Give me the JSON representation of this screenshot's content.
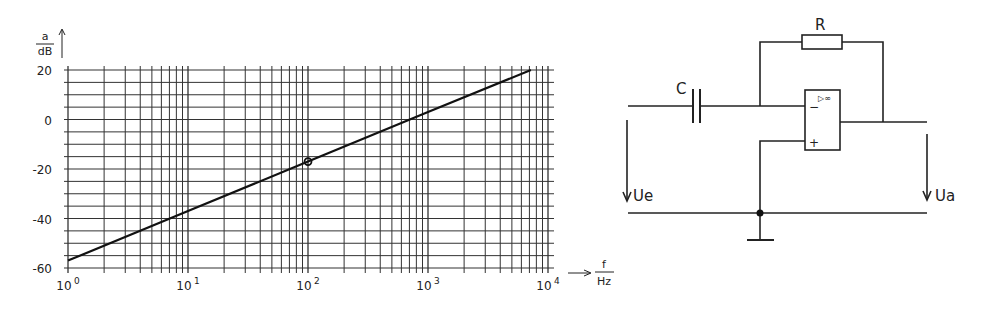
{
  "chart_data": {
    "type": "line",
    "title": "",
    "xlabel_num": "f",
    "xlabel_den": "Hz",
    "ylabel_num": "a",
    "ylabel_den": "dB",
    "xscale": "log",
    "xlim": [
      1,
      10000
    ],
    "ylim": [
      -60,
      20
    ],
    "grid": true,
    "legend": null,
    "x_ticks": [
      {
        "base": "10",
        "exp": "0"
      },
      {
        "base": "10",
        "exp": "1"
      },
      {
        "base": "10",
        "exp": "2"
      },
      {
        "base": "10",
        "exp": "3"
      },
      {
        "base": "10",
        "exp": "4"
      }
    ],
    "y_ticks": [
      "20",
      "0",
      "-20",
      "-40",
      "-60"
    ],
    "series": [
      {
        "name": "a (differentiator gain)",
        "x": [
          1,
          10,
          100,
          1000,
          7200
        ],
        "y": [
          -57,
          -37,
          -17,
          3,
          20
        ],
        "slope_db_per_decade": 20
      }
    ],
    "annotations": [
      {
        "type": "marker",
        "x": 100,
        "y": -17
      }
    ]
  },
  "circuit": {
    "capacitor_label": "C",
    "resistor_label": "R",
    "opamp_symbol": "▷∞",
    "opamp_minus": "−",
    "opamp_plus": "+",
    "input_voltage_label": "Ue",
    "output_voltage_label": "Ua"
  }
}
